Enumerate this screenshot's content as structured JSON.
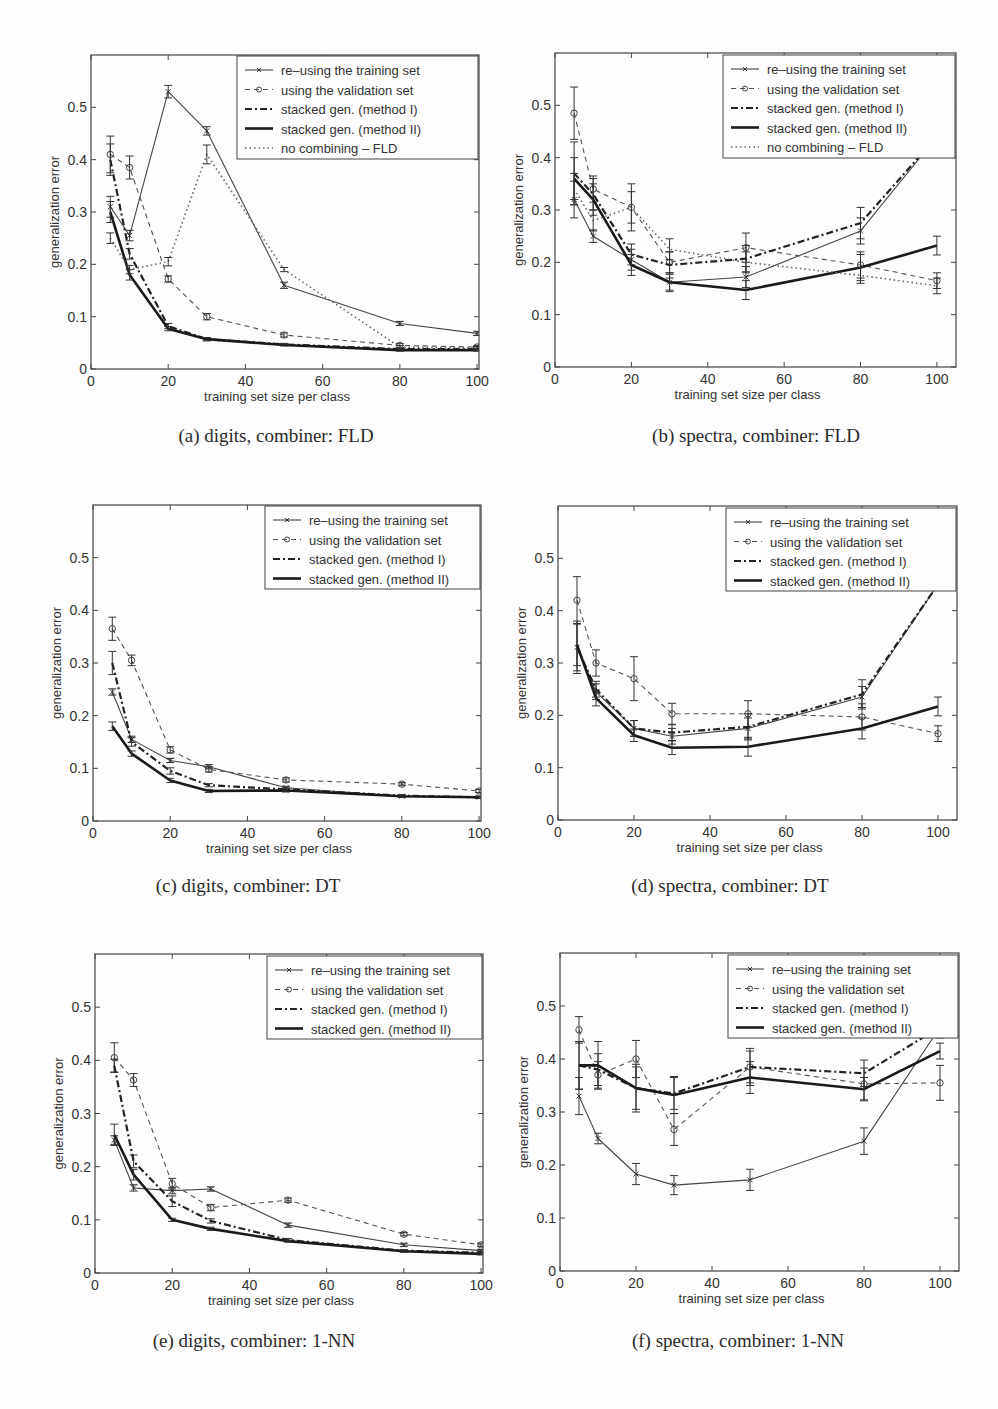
{
  "series_styles": {
    "training": {
      "label": "re–using the training set",
      "marker": "x",
      "dash": "",
      "width": 1.1,
      "color": "#444444"
    },
    "validation": {
      "label": "using the validation set",
      "marker": "o",
      "dash": "5,4",
      "width": 1.1,
      "color": "#555555"
    },
    "method1": {
      "label": "stacked gen. (method I)",
      "marker": "",
      "dash": "7,3,2,3",
      "width": 2.2,
      "color": "#222222"
    },
    "method2": {
      "label": "stacked gen. (method II)",
      "marker": "",
      "dash": "",
      "width": 2.6,
      "color": "#1a1a1a"
    },
    "nocomb": {
      "label": "no combining – FLD",
      "marker": "",
      "dash": "1.5,3",
      "width": 1.6,
      "color": "#666666"
    }
  },
  "chart_data": [
    {
      "id": "a",
      "type": "line",
      "caption": "(a) digits, combiner: FLD",
      "xlabel": "training set size per class",
      "ylabel": "generalization error",
      "x": [
        5,
        10,
        20,
        30,
        50,
        80,
        100
      ],
      "xticks": [
        0,
        20,
        40,
        60,
        80,
        100
      ],
      "yticks": [
        0,
        0.1,
        0.2,
        0.3,
        0.4,
        0.5
      ],
      "xlim": [
        0,
        100.5
      ],
      "ylim": [
        0,
        0.6
      ],
      "frame": {
        "left": 91,
        "top": 55,
        "right": 479,
        "bottom": 369
      },
      "legend": {
        "left": 237,
        "top": 56,
        "width": 241,
        "height": 103
      },
      "series": [
        {
          "key": "training",
          "values": [
            0.31,
            0.255,
            0.53,
            0.455,
            0.16,
            0.087,
            0.068
          ],
          "err": [
            0.02,
            0.01,
            0.012,
            0.008,
            0.006,
            0.004,
            0.004
          ]
        },
        {
          "key": "validation",
          "values": [
            0.41,
            0.385,
            0.172,
            0.1,
            0.065,
            0.045,
            0.042
          ],
          "err": [
            0.035,
            0.022,
            0.006,
            0.006,
            0.004,
            0.004,
            0.003
          ]
        },
        {
          "key": "method1",
          "values": [
            0.4,
            0.22,
            0.082,
            0.057,
            0.047,
            0.038,
            0.038
          ],
          "err": [
            0.03,
            0.01,
            0.005,
            0.003,
            0.002,
            0.002,
            0.002
          ]
        },
        {
          "key": "method2",
          "values": [
            0.3,
            0.18,
            0.077,
            0.057,
            0.046,
            0.036,
            0.036
          ],
          "err": [
            0.02,
            0.01,
            0.004,
            0.003,
            0.002,
            0.002,
            0.002
          ]
        },
        {
          "key": "nocomb",
          "values": [
            0.25,
            0.19,
            0.205,
            0.41,
            0.19,
            0.042,
            0.04
          ],
          "err": [
            0.01,
            0.008,
            0.008,
            0.018,
            0.004,
            0.003,
            0.003
          ]
        }
      ]
    },
    {
      "id": "b",
      "type": "line",
      "caption": "(b) spectra, combiner: FLD",
      "xlabel": "training set size per class",
      "ylabel": "generalization error",
      "x": [
        5,
        10,
        20,
        30,
        50,
        80,
        100
      ],
      "xticks": [
        0,
        20,
        40,
        60,
        80,
        100
      ],
      "yticks": [
        0,
        0.1,
        0.2,
        0.3,
        0.4,
        0.5
      ],
      "xlim": [
        0,
        105
      ],
      "ylim": [
        0,
        0.6
      ],
      "frame": {
        "left": 555,
        "top": 53,
        "right": 956,
        "bottom": 367
      },
      "legend": {
        "left": 723,
        "top": 55,
        "width": 232,
        "height": 103
      },
      "series": [
        {
          "key": "training",
          "values": [
            0.32,
            0.25,
            0.205,
            0.162,
            0.172,
            0.26,
            0.44
          ],
          "err": [
            0.035,
            0.012,
            0.02,
            0.015,
            0.02,
            0.025,
            0.02
          ]
        },
        {
          "key": "validation",
          "values": [
            0.485,
            0.34,
            0.305,
            0.2,
            0.228,
            0.195,
            0.165
          ],
          "err": [
            0.05,
            0.025,
            0.045,
            0.02,
            0.028,
            0.025,
            0.015
          ]
        },
        {
          "key": "method1",
          "values": [
            0.37,
            0.33,
            0.215,
            0.195,
            0.207,
            0.275,
            0.44
          ],
          "err": [
            0.06,
            0.03,
            0.02,
            0.025,
            0.025,
            0.03,
            0.02
          ]
        },
        {
          "key": "method2",
          "values": [
            0.36,
            0.32,
            0.195,
            0.162,
            0.147,
            0.19,
            0.232
          ],
          "err": [
            0.04,
            0.03,
            0.02,
            0.018,
            0.018,
            0.025,
            0.018
          ]
        },
        {
          "key": "nocomb",
          "values": [
            0.34,
            0.28,
            0.305,
            0.225,
            0.2,
            0.175,
            0.155
          ],
          "err": [
            0.03,
            0.02,
            0.03,
            0.02,
            0.02,
            0.015,
            0.015
          ]
        }
      ]
    },
    {
      "id": "c",
      "type": "line",
      "caption": "(c) digits, combiner: DT",
      "xlabel": "training set size per class",
      "ylabel": "generalization error",
      "x": [
        5,
        10,
        20,
        30,
        50,
        80,
        100
      ],
      "xticks": [
        0,
        20,
        40,
        60,
        80,
        100
      ],
      "yticks": [
        0,
        0.1,
        0.2,
        0.3,
        0.4,
        0.5
      ],
      "xlim": [
        0,
        100.5
      ],
      "ylim": [
        0,
        0.6
      ],
      "frame": {
        "left": 93,
        "top": 505,
        "right": 481,
        "bottom": 821
      },
      "legend": {
        "left": 265,
        "top": 506,
        "width": 215,
        "height": 83
      },
      "series": [
        {
          "key": "training",
          "values": [
            0.245,
            0.155,
            0.115,
            0.103,
            0.063,
            0.047,
            0.045
          ],
          "err": [
            0.006,
            0.006,
            0.004,
            0.004,
            0.003,
            0.002,
            0.002
          ]
        },
        {
          "key": "validation",
          "values": [
            0.365,
            0.305,
            0.135,
            0.098,
            0.078,
            0.07,
            0.057
          ],
          "err": [
            0.022,
            0.01,
            0.006,
            0.005,
            0.004,
            0.003,
            0.003
          ]
        },
        {
          "key": "method1",
          "values": [
            0.3,
            0.15,
            0.095,
            0.068,
            0.06,
            0.048,
            0.045
          ],
          "err": [
            0.022,
            0.008,
            0.006,
            0.003,
            0.003,
            0.002,
            0.002
          ]
        },
        {
          "key": "method2",
          "values": [
            0.18,
            0.128,
            0.077,
            0.057,
            0.058,
            0.047,
            0.045
          ],
          "err": [
            0.008,
            0.005,
            0.004,
            0.003,
            0.003,
            0.002,
            0.002
          ]
        }
      ]
    },
    {
      "id": "d",
      "type": "line",
      "caption": "(d) spectra, combiner: DT",
      "xlabel": "training set size per class",
      "ylabel": "generalization error",
      "x": [
        5,
        10,
        20,
        30,
        50,
        80,
        100
      ],
      "xticks": [
        0,
        20,
        40,
        60,
        80,
        100
      ],
      "yticks": [
        0,
        0.1,
        0.2,
        0.3,
        0.4,
        0.5
      ],
      "xlim": [
        0,
        105
      ],
      "ylim": [
        0,
        0.6
      ],
      "frame": {
        "left": 558,
        "top": 506,
        "right": 957,
        "bottom": 820
      },
      "legend": {
        "left": 726,
        "top": 508,
        "width": 230,
        "height": 83
      },
      "series": [
        {
          "key": "training",
          "values": [
            0.33,
            0.245,
            0.175,
            0.16,
            0.175,
            0.235,
            0.45
          ],
          "err": [
            0.045,
            0.015,
            0.015,
            0.015,
            0.02,
            0.02,
            0.01
          ]
        },
        {
          "key": "validation",
          "values": [
            0.42,
            0.3,
            0.27,
            0.203,
            0.203,
            0.197,
            0.165
          ],
          "err": [
            0.045,
            0.025,
            0.042,
            0.02,
            0.025,
            0.025,
            0.015
          ]
        },
        {
          "key": "method1",
          "values": [
            0.33,
            0.25,
            0.175,
            0.167,
            0.178,
            0.24,
            0.45
          ],
          "err": [
            0.05,
            0.015,
            0.015,
            0.015,
            0.025,
            0.028,
            0.01
          ]
        },
        {
          "key": "method2",
          "values": [
            0.335,
            0.233,
            0.162,
            0.138,
            0.14,
            0.175,
            0.217
          ],
          "err": [
            0.04,
            0.015,
            0.012,
            0.013,
            0.018,
            0.02,
            0.018
          ]
        }
      ]
    },
    {
      "id": "e",
      "type": "line",
      "caption": "(e) digits, combiner: 1-NN",
      "xlabel": "training set size per class",
      "ylabel": "generalization error",
      "x": [
        5,
        10,
        20,
        30,
        50,
        80,
        100
      ],
      "xticks": [
        0,
        20,
        40,
        60,
        80,
        100
      ],
      "yticks": [
        0,
        0.1,
        0.2,
        0.3,
        0.4,
        0.5
      ],
      "xlim": [
        0,
        100.5
      ],
      "ylim": [
        0,
        0.6
      ],
      "frame": {
        "left": 95,
        "top": 954,
        "right": 483,
        "bottom": 1273
      },
      "legend": {
        "left": 267,
        "top": 956,
        "width": 215,
        "height": 83
      },
      "series": [
        {
          "key": "training",
          "values": [
            0.25,
            0.16,
            0.155,
            0.158,
            0.09,
            0.053,
            0.042
          ],
          "err": [
            0.008,
            0.006,
            0.006,
            0.004,
            0.004,
            0.003,
            0.002
          ]
        },
        {
          "key": "validation",
          "values": [
            0.405,
            0.363,
            0.168,
            0.123,
            0.137,
            0.073,
            0.053
          ],
          "err": [
            0.028,
            0.012,
            0.01,
            0.006,
            0.004,
            0.003,
            0.003
          ]
        },
        {
          "key": "method1",
          "values": [
            0.39,
            0.21,
            0.135,
            0.098,
            0.062,
            0.042,
            0.038
          ],
          "err": [
            0.012,
            0.012,
            0.01,
            0.004,
            0.003,
            0.002,
            0.002
          ]
        },
        {
          "key": "method2",
          "values": [
            0.26,
            0.185,
            0.1,
            0.083,
            0.06,
            0.041,
            0.036
          ],
          "err": [
            0.02,
            0.01,
            0.003,
            0.003,
            0.002,
            0.002,
            0.002
          ]
        }
      ]
    },
    {
      "id": "f",
      "type": "line",
      "caption": "(f) spectra, combiner: 1-NN",
      "xlabel": "training set size per class",
      "ylabel": "generalization error",
      "x": [
        5,
        10,
        20,
        30,
        50,
        80,
        100
      ],
      "xticks": [
        0,
        20,
        40,
        60,
        80,
        100
      ],
      "yticks": [
        0,
        0.1,
        0.2,
        0.3,
        0.4,
        0.5
      ],
      "xlim": [
        0,
        105
      ],
      "ylim": [
        0,
        0.6
      ],
      "frame": {
        "left": 560,
        "top": 953,
        "right": 959,
        "bottom": 1271
      },
      "legend": {
        "left": 728,
        "top": 955,
        "width": 230,
        "height": 83
      },
      "series": [
        {
          "key": "training",
          "values": [
            0.33,
            0.25,
            0.183,
            0.162,
            0.172,
            0.245,
            0.46
          ],
          "err": [
            0.035,
            0.01,
            0.02,
            0.018,
            0.02,
            0.025,
            0.02
          ]
        },
        {
          "key": "validation",
          "values": [
            0.455,
            0.37,
            0.4,
            0.267,
            0.385,
            0.353,
            0.355
          ],
          "err": [
            0.025,
            0.025,
            0.035,
            0.03,
            0.035,
            0.03,
            0.033
          ]
        },
        {
          "key": "method1",
          "values": [
            0.388,
            0.38,
            0.345,
            0.335,
            0.385,
            0.373,
            0.46
          ],
          "err": [
            0.045,
            0.03,
            0.04,
            0.03,
            0.03,
            0.025,
            0.02
          ]
        },
        {
          "key": "method2",
          "values": [
            0.388,
            0.388,
            0.345,
            0.332,
            0.365,
            0.343,
            0.415
          ],
          "err": [
            0.045,
            0.045,
            0.045,
            0.035,
            0.03,
            0.022,
            0.015
          ]
        }
      ]
    }
  ]
}
